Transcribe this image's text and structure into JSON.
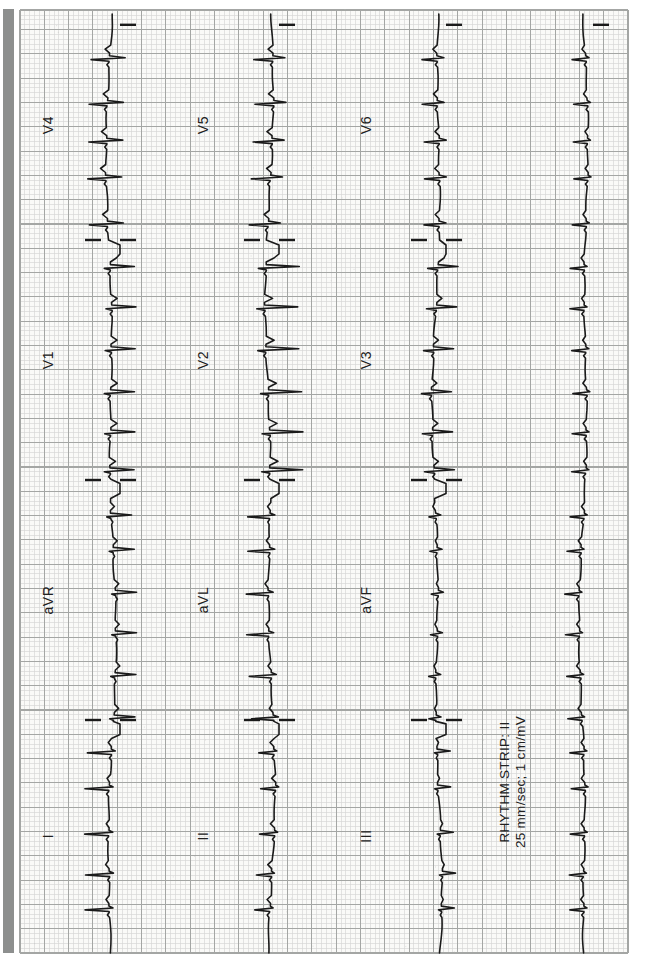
{
  "page": {
    "bg": "#ffffff",
    "edge_bar": {
      "color": "#8d8f8e",
      "x": 3,
      "y": 9,
      "width": 11,
      "height": 944
    }
  },
  "ecg": {
    "grid": {
      "paper_color": "#fafaf8",
      "minor_color": "#d5d6d4",
      "major_color": "#a4a6a4",
      "minor_px": 4.86,
      "minor_py": 4.864,
      "major_px": 24.3,
      "major_py": 24.32
    },
    "trace_color": "#1a1a1a",
    "label_color": "#202020",
    "rhythm_label_line1": "RHYTHM STRIP: II",
    "rhythm_label_line2": "25 mm/sec; 1 cm/mV",
    "rhythm_label_x": 194,
    "rhythm_label_y1": 509,
    "rhythm_label_y2": 525
  },
  "chart_data": {
    "type": "line",
    "paper_speed": "25 mm/sec",
    "calibration": "1 cm/mV",
    "rhythm_lead": "II",
    "seconds_per_large_square": 0.2,
    "heart_rhythm_note": "narrow-complex tachycardia, slightly irregular, approx 160-180 bpm",
    "layout_rows": [
      [
        "I",
        "aVR",
        "V1",
        "V4"
      ],
      [
        "II",
        "aVL",
        "V2",
        "V5"
      ],
      [
        "III",
        "aVF",
        "V3",
        "V6"
      ],
      [
        "RHYTHM II"
      ]
    ],
    "x_start": 23,
    "x_end": 966,
    "trace_end": 962,
    "y_top": 20,
    "y_bottom": 628,
    "rr_px": 40,
    "rr_jitter_px": 12,
    "boundaries": [
      256,
      496,
      736
    ],
    "segment_centers": [
      140,
      376,
      616,
      851
    ],
    "rows": [
      {
        "baseline": 111,
        "label_y": 53,
        "leads": [
          {
            "label": "I",
            "r": 24,
            "s": 4,
            "t": 3,
            "p": 2
          },
          {
            "label": "aVR",
            "r": 4,
            "s": 21,
            "t": -4,
            "p": -1.5
          },
          {
            "label": "V1",
            "r": 6,
            "s": 24,
            "t": -6,
            "p": 2
          },
          {
            "label": "V4",
            "r": 18,
            "s": 16,
            "t": 5,
            "p": 2
          }
        ]
      },
      {
        "baseline": 270,
        "label_y": 208,
        "leads": [
          {
            "label": "II",
            "r": 15,
            "s": 3,
            "t": 4,
            "p": 2
          },
          {
            "label": "aVL",
            "r": 22,
            "s": 5,
            "t": 3,
            "p": 1.5
          },
          {
            "label": "V2",
            "r": 8,
            "s": 33,
            "t": -8,
            "p": 2
          },
          {
            "label": "V5",
            "r": 19,
            "s": 12,
            "t": 5,
            "p": 2
          }
        ]
      },
      {
        "baseline": 437,
        "label_y": 371,
        "leads": [
          {
            "label": "III",
            "r": 3,
            "s": 13,
            "t": -2,
            "p": 1.5
          },
          {
            "label": "aVF",
            "r": 7,
            "s": 5,
            "t": 2,
            "p": 1.5
          },
          {
            "label": "V3",
            "r": 10,
            "s": 20,
            "t": -5,
            "p": 2
          },
          {
            "label": "V6",
            "r": 15,
            "s": 7,
            "t": 4,
            "p": 2
          }
        ]
      },
      {
        "baseline": 584,
        "leads": [
          {
            "label": "II",
            "r": 14,
            "s": 3,
            "t": 3,
            "p": 2
          }
        ]
      }
    ]
  }
}
